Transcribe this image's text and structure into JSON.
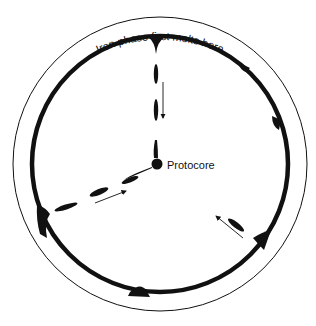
{
  "diagram": {
    "top_arc_label": "Iron phase first melts here",
    "core_label": "Protocore",
    "colors": {
      "ink": "#111111",
      "background": "#ffffff"
    }
  }
}
